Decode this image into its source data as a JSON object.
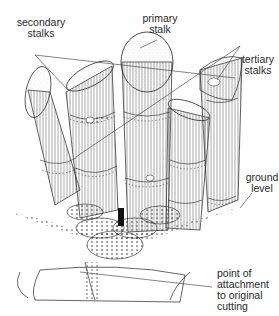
{
  "diagram": {
    "colors": {
      "ink": "#1a1a1a",
      "background": "#ffffff",
      "text": "#2a2a2a"
    },
    "labels": [
      {
        "id": "secondary",
        "text": "secondary\nstalks"
      },
      {
        "id": "primary",
        "text": "primary\nstalk"
      },
      {
        "id": "tertiary",
        "text": "tertiary\nstalks"
      },
      {
        "id": "ground",
        "text": "ground\nlevel"
      },
      {
        "id": "attachment",
        "text": "point of\nattachment\nto original\ncutting"
      }
    ]
  }
}
